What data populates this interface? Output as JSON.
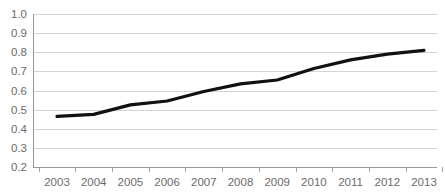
{
  "chart_data": {
    "type": "line",
    "title": "",
    "subtitle": "",
    "xlabel": "",
    "ylabel": "",
    "categories": [
      "2003",
      "2004",
      "2005",
      "2006",
      "2007",
      "2008",
      "2009",
      "2010",
      "2011",
      "2012",
      "2013"
    ],
    "x": [
      2003,
      2004,
      2005,
      2006,
      2007,
      2008,
      2009,
      2010,
      2011,
      2012,
      2013
    ],
    "values": [
      0.465,
      0.475,
      0.525,
      0.545,
      0.595,
      0.635,
      0.655,
      0.715,
      0.76,
      0.79,
      0.81
    ],
    "series": [
      {
        "name": "",
        "values": [
          0.465,
          0.475,
          0.525,
          0.545,
          0.595,
          0.635,
          0.655,
          0.715,
          0.76,
          0.79,
          0.81
        ]
      }
    ],
    "ylim": [
      0.2,
      1.0
    ],
    "xlim": [
      2003,
      2013
    ],
    "ytick_labels": [
      "1.0",
      "0.9",
      "0.8",
      "0.7",
      "0.6",
      "0.5",
      "0.4",
      "0.3",
      "0.2"
    ],
    "ytick_values": [
      1.0,
      0.9,
      0.8,
      0.7,
      0.6,
      0.5,
      0.4,
      0.3,
      0.2
    ],
    "xtick_labels": [
      "2003",
      "2004",
      "2005",
      "2006",
      "2007",
      "2008",
      "2009",
      "2010",
      "2011",
      "2012",
      "2013"
    ],
    "grid": true,
    "grid_axis": "y",
    "legend": false,
    "legend_position": "none",
    "annotations": [],
    "colors": {
      "line": "#111111",
      "grid": "#c9c9c9",
      "axis": "#9a9a9a",
      "tick_label": "#6b6b6b",
      "background": "#ffffff"
    }
  }
}
